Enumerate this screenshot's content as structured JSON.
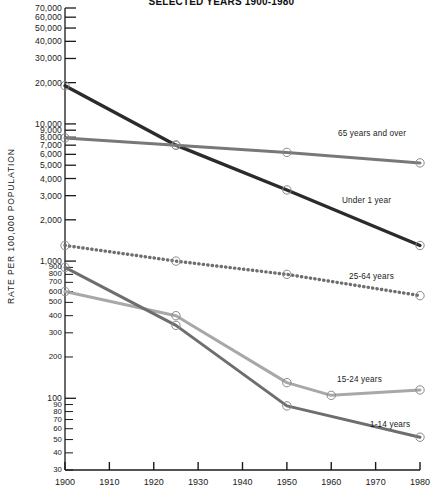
{
  "chart_data": {
    "type": "line",
    "title": "SELECTED YEARS 1900-1980",
    "xlabel": "",
    "ylabel": "RATE PER 100,000 POPULATION",
    "yscale": "log",
    "ylim": [
      30,
      70000
    ],
    "xlim": [
      1900,
      1980
    ],
    "grid": false,
    "legend_position": "inline-right",
    "x_ticks": [
      1900,
      1910,
      1920,
      1930,
      1940,
      1950,
      1960,
      1970,
      1980
    ],
    "x_tick_labels": [
      "1900",
      "1910",
      "1920",
      "1930",
      "1940",
      "1950",
      "1960",
      "1970",
      "1980"
    ],
    "y_ticks": [
      30,
      40,
      50,
      60,
      70,
      80,
      90,
      100,
      200,
      300,
      400,
      500,
      600,
      700,
      800,
      900,
      1000,
      2000,
      3000,
      4000,
      5000,
      6000,
      7000,
      8000,
      9000,
      10000,
      20000,
      30000,
      40000,
      50000,
      60000,
      70000
    ],
    "y_tick_labels": [
      "30",
      "40",
      "50",
      "60",
      "70",
      "80",
      "90",
      "100",
      "200",
      "300",
      "400",
      "500",
      "600",
      "700",
      "800",
      "900",
      "1,000",
      "2,000",
      "3,000",
      "4,000",
      "5,000",
      "6,000",
      "7,000",
      "8,000",
      "9,000",
      "10,000",
      "20,000",
      "30,000",
      "40,000",
      "50,000",
      "60,000",
      "70,000"
    ],
    "series": [
      {
        "name": "Under 1 year",
        "label": "Under 1 year",
        "color": "#2b2b2b",
        "style": "solid",
        "width": 3.4,
        "x": [
          1900,
          1925,
          1950,
          1980
        ],
        "values": [
          19000,
          7000,
          3300,
          1300
        ]
      },
      {
        "name": "65 years and over",
        "label": "65 years and over",
        "color": "#787878",
        "style": "solid",
        "width": 3.0,
        "x": [
          1900,
          1925,
          1950,
          1980
        ],
        "values": [
          7900,
          7000,
          6200,
          5200
        ]
      },
      {
        "name": "25-64 years",
        "label": "25-64 years",
        "color": "#6e6e6e",
        "style": "dotted",
        "width": 3.4,
        "x": [
          1900,
          1925,
          1950,
          1980
        ],
        "values": [
          1300,
          1000,
          800,
          560
        ]
      },
      {
        "name": "15-24 years",
        "label": "15-24 years",
        "color": "#a8a8a8",
        "style": "solid",
        "width": 3.0,
        "x": [
          1900,
          1925,
          1950,
          1960,
          1980
        ],
        "values": [
          600,
          400,
          130,
          105,
          115
        ]
      },
      {
        "name": "1-14 years",
        "label": "1-14 years",
        "color": "#6e6e6e",
        "style": "solid",
        "width": 3.0,
        "x": [
          1900,
          1925,
          1950,
          1980
        ],
        "values": [
          900,
          340,
          88,
          52
        ]
      }
    ],
    "annotations": [
      {
        "text": "65 years and over",
        "x_px": 338,
        "y_px": 129
      },
      {
        "text": "Under 1 year",
        "x_px": 342,
        "y_px": 196
      },
      {
        "text": "25-64 years",
        "x_px": 349,
        "y_px": 272
      },
      {
        "text": "15-24 years",
        "x_px": 337,
        "y_px": 375
      },
      {
        "text": "1-14 years",
        "x_px": 370,
        "y_px": 420
      }
    ]
  }
}
